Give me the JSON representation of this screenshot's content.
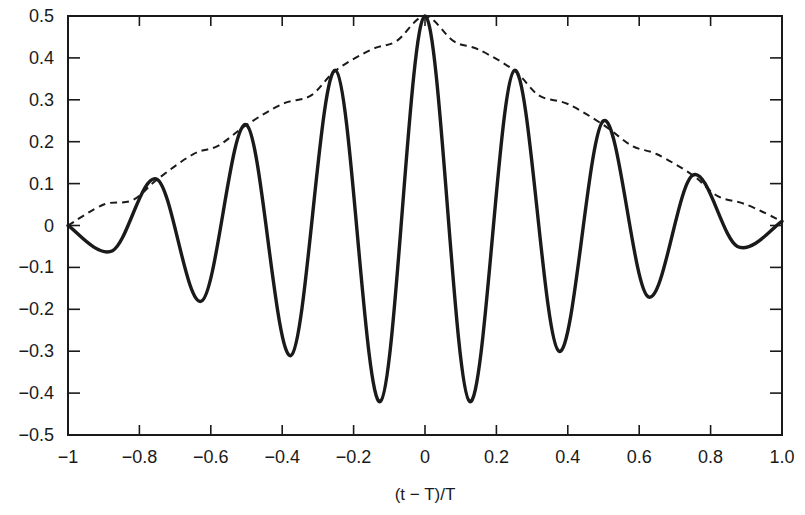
{
  "chart_data": {
    "type": "line",
    "title": "",
    "xlabel": "(t − T)/T",
    "ylabel": "",
    "xlim": [
      -1,
      1
    ],
    "ylim": [
      -0.5,
      0.5
    ],
    "grid": false,
    "legend": null,
    "xticks": [
      -1,
      -0.8,
      -0.6,
      -0.4,
      -0.2,
      0,
      0.2,
      0.4,
      0.6,
      0.8,
      1.0
    ],
    "xtick_labels": [
      "−1",
      "−0.8",
      "−0.6",
      "−0.4",
      "−0.2",
      "0",
      "0.2",
      "0.4",
      "0.6",
      "0.8",
      "1.0"
    ],
    "yticks": [
      0.5,
      0.4,
      0.3,
      0.2,
      0.1,
      0,
      -0.1,
      -0.2,
      -0.3,
      -0.4,
      -0.5
    ],
    "ytick_labels": [
      "0.5",
      "0.4",
      "0.3",
      "0.2",
      "0.1",
      "0",
      "−0.1",
      "−0.2",
      "−0.3",
      "−0.4",
      "−0.5"
    ],
    "series": [
      {
        "name": "signal",
        "style": "solid",
        "x": [
          -1,
          -0.875,
          -0.75,
          -0.625,
          -0.5,
          -0.375,
          -0.25,
          -0.125,
          0,
          0.125,
          0.25,
          0.375,
          0.5,
          0.625,
          0.75,
          0.875,
          1
        ],
        "y": [
          0,
          -0.06,
          0.11,
          -0.18,
          0.24,
          -0.31,
          0.37,
          -0.42,
          0.5,
          -0.42,
          0.37,
          -0.3,
          0.25,
          -0.17,
          0.12,
          -0.05,
          0.01
        ]
      },
      {
        "name": "envelope",
        "style": "dashed",
        "x": [
          -1,
          -0.9,
          -0.82,
          -0.75,
          -0.65,
          -0.58,
          -0.5,
          -0.4,
          -0.32,
          -0.25,
          -0.15,
          -0.08,
          0,
          0.08,
          0.15,
          0.25,
          0.32,
          0.4,
          0.5,
          0.58,
          0.65,
          0.75,
          0.82,
          0.9,
          1
        ],
        "y": [
          0,
          0.05,
          0.06,
          0.11,
          0.17,
          0.19,
          0.24,
          0.29,
          0.31,
          0.37,
          0.42,
          0.44,
          0.5,
          0.44,
          0.42,
          0.37,
          0.31,
          0.29,
          0.24,
          0.19,
          0.17,
          0.12,
          0.07,
          0.05,
          0.01
        ]
      }
    ]
  }
}
